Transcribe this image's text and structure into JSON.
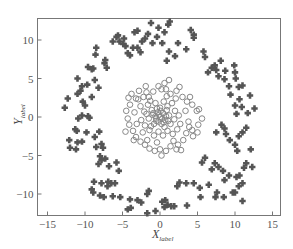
{
  "chart_data": {
    "type": "scatter",
    "title": "",
    "xlabel": "X",
    "xlabel_subscript": "label",
    "ylabel": "Y",
    "ylabel_subscript": "label",
    "xlim": [
      -16.5,
      16
    ],
    "ylim": [
      -12.9,
      12.7
    ],
    "xticks": [
      -15,
      -10,
      -5,
      0,
      5,
      10,
      15
    ],
    "yticks": [
      -10,
      -5,
      0,
      5,
      10
    ],
    "grid": false,
    "legend": null,
    "series": [
      {
        "name": "outer-ring",
        "marker": "plus-diamond-filled",
        "color": "#555555",
        "points": [
          [
            -12.3,
            2.4
          ],
          [
            -12.7,
            1.2
          ],
          [
            -12.1,
            -3.0
          ],
          [
            -12.0,
            -4.0
          ],
          [
            -11.2,
            -4.2
          ],
          [
            -11.0,
            -3.3
          ],
          [
            -11.1,
            -1.8
          ],
          [
            -11.3,
            -1.6
          ],
          [
            -10.4,
            -3.2
          ],
          [
            -11.0,
            3.0
          ],
          [
            -10.6,
            3.4
          ],
          [
            -10.3,
            2.0
          ],
          [
            -10.0,
            1.5
          ],
          [
            -10.4,
            0.2
          ],
          [
            -10.9,
            -0.2
          ],
          [
            -9.6,
            0.1
          ],
          [
            -9.1,
            2.6
          ],
          [
            -11.0,
            5.0
          ],
          [
            -10.4,
            4.0
          ],
          [
            -9.7,
            4.2
          ],
          [
            -9.6,
            6.5
          ],
          [
            -9.1,
            6.2
          ],
          [
            -8.9,
            6.3
          ],
          [
            -8.7,
            4.8
          ],
          [
            -8.2,
            3.8
          ],
          [
            -8.5,
            9.0
          ],
          [
            -8.6,
            8.1
          ],
          [
            -7.4,
            7.0
          ],
          [
            -7.3,
            7.4
          ],
          [
            -7.1,
            6.4
          ],
          [
            -6.3,
            9.8
          ],
          [
            -5.8,
            10.4
          ],
          [
            -5.6,
            10.6
          ],
          [
            -5.4,
            9.8
          ],
          [
            -4.9,
            9.5
          ],
          [
            -4.8,
            10.2
          ],
          [
            -4.3,
            8.3
          ],
          [
            -4.0,
            8.0
          ],
          [
            -4.6,
            9.2
          ],
          [
            -3.6,
            9.0
          ],
          [
            -3.0,
            9.0
          ],
          [
            -2.6,
            8.4
          ],
          [
            -1.6,
            10.8
          ],
          [
            -1.2,
            12.2
          ],
          [
            -0.4,
            10.4
          ],
          [
            0.3,
            9.6
          ],
          [
            0.6,
            11.0
          ],
          [
            1.1,
            12.0
          ],
          [
            1.3,
            12.4
          ],
          [
            -1.0,
            9.6
          ],
          [
            -0.2,
            11.6
          ],
          [
            1.2,
            8.5
          ],
          [
            0.9,
            7.3
          ],
          [
            2.0,
            7.9
          ],
          [
            2.4,
            9.6
          ],
          [
            3.5,
            8.8
          ],
          [
            4.1,
            11.3
          ],
          [
            4.5,
            10.7
          ],
          [
            4.5,
            10.3
          ],
          [
            5.8,
            8.5
          ],
          [
            6.0,
            7.8
          ],
          [
            6.4,
            5.8
          ],
          [
            6.9,
            6.4
          ],
          [
            7.5,
            6.1
          ],
          [
            7.3,
            6.7
          ],
          [
            7.8,
            5.3
          ],
          [
            8.1,
            7.3
          ],
          [
            8.6,
            4.9
          ],
          [
            8.7,
            6.0
          ],
          [
            9.2,
            4.0
          ],
          [
            9.9,
            6.7
          ],
          [
            10.0,
            5.8
          ],
          [
            10.1,
            5.0
          ],
          [
            10.5,
            3.9
          ],
          [
            11.0,
            4.1
          ],
          [
            9.4,
            2.9
          ],
          [
            10.6,
            2.3
          ],
          [
            10.0,
            1.5
          ],
          [
            10.9,
            1.3
          ],
          [
            10.2,
            0.4
          ],
          [
            12.0,
            2.8
          ],
          [
            12.6,
            1.1
          ],
          [
            11.7,
            0.5
          ],
          [
            8.2,
            -1.0
          ],
          [
            8.6,
            -1.5
          ],
          [
            7.5,
            -2.0
          ],
          [
            8.8,
            -2.2
          ],
          [
            9.3,
            -3.0
          ],
          [
            10.0,
            -3.6
          ],
          [
            10.5,
            -2.5
          ],
          [
            11.0,
            -2.0
          ],
          [
            11.5,
            -1.4
          ],
          [
            10.3,
            -4.4
          ],
          [
            12.1,
            -4.2
          ],
          [
            5.6,
            -5.9
          ],
          [
            6.0,
            -5.3
          ],
          [
            7.3,
            -6.0
          ],
          [
            6.9,
            -6.8
          ],
          [
            7.8,
            -6.5
          ],
          [
            8.4,
            -7.0
          ],
          [
            9.2,
            -7.6
          ],
          [
            10.2,
            -7.8
          ],
          [
            10.6,
            -7.6
          ],
          [
            11.2,
            -6.6
          ],
          [
            11.5,
            -6.0
          ],
          [
            11.0,
            -8.6
          ],
          [
            10.5,
            -9.0
          ],
          [
            10.0,
            -9.8
          ],
          [
            11.0,
            -10.9
          ],
          [
            12.3,
            -6.5
          ],
          [
            8.6,
            -8.2
          ],
          [
            7.6,
            -9.8
          ],
          [
            7.4,
            -10.4
          ],
          [
            8.5,
            -10.4
          ],
          [
            9.7,
            -9.8
          ],
          [
            5.3,
            -9.2
          ],
          [
            2.3,
            -9.0
          ],
          [
            2.6,
            -8.5
          ],
          [
            3.5,
            -8.6
          ],
          [
            4.5,
            -8.6
          ],
          [
            6.5,
            -8.8
          ],
          [
            5.4,
            -10.4
          ],
          [
            3.6,
            -11.5
          ],
          [
            0.7,
            -10.8
          ],
          [
            1.0,
            -11.4
          ],
          [
            -1.5,
            -9.6
          ],
          [
            -1.7,
            -10.0
          ],
          [
            0.3,
            -11.0
          ],
          [
            0.6,
            -11.7
          ],
          [
            1.5,
            -11.6
          ],
          [
            1.9,
            -11.6
          ],
          [
            -0.6,
            -12.2
          ],
          [
            -1.7,
            -12.5
          ],
          [
            -3.9,
            -11.8
          ],
          [
            -4.3,
            -12.0
          ],
          [
            -2.5,
            -11.1
          ],
          [
            -3.0,
            -10.8
          ],
          [
            -4.0,
            -10.7
          ],
          [
            -5.3,
            -10.4
          ],
          [
            -6.3,
            -10.3
          ],
          [
            -7.5,
            -10.4
          ],
          [
            -8.0,
            -10.2
          ],
          [
            -8.9,
            -9.8
          ],
          [
            -9.1,
            -9.4
          ],
          [
            -8.8,
            -8.4
          ],
          [
            -7.8,
            -8.6
          ],
          [
            -7.0,
            -9.0
          ],
          [
            -6.9,
            -8.4
          ],
          [
            -6.5,
            -8.6
          ],
          [
            -6.0,
            -8.6
          ],
          [
            -7.8,
            -5.6
          ],
          [
            -8.0,
            -5.1
          ],
          [
            -8.2,
            -6.1
          ],
          [
            -7.3,
            -5.4
          ],
          [
            -6.8,
            -6.4
          ],
          [
            -5.5,
            -7.0
          ],
          [
            -5.8,
            -5.9
          ],
          [
            -9.4,
            -0.1
          ],
          [
            -9.8,
            -2.0
          ],
          [
            -8.1,
            -1.9
          ],
          [
            -7.8,
            -3.5
          ],
          [
            -7.6,
            -4.0
          ],
          [
            -8.7,
            -2.6
          ],
          [
            -8.5,
            -3.9
          ],
          [
            -3.0,
            11.2
          ],
          [
            -2.0,
            10.2
          ],
          [
            -3.4,
            11.0
          ],
          [
            -2.4,
            9.8
          ]
        ]
      },
      {
        "name": "inner-cluster",
        "marker": "circle-open",
        "color": "#888888",
        "points": [
          [
            -3.8,
            3.0
          ],
          [
            -3.2,
            2.4
          ],
          [
            -2.9,
            2.3
          ],
          [
            -2.8,
            3.4
          ],
          [
            -2.2,
            2.6
          ],
          [
            -1.8,
            3.2
          ],
          [
            -1.3,
            2.1
          ],
          [
            -0.9,
            3.3
          ],
          [
            -0.2,
            4.0
          ],
          [
            0.2,
            3.6
          ],
          [
            0.6,
            4.4
          ],
          [
            0.8,
            3.6
          ],
          [
            1.4,
            3.0
          ],
          [
            2.2,
            3.4
          ],
          [
            2.6,
            3.9
          ],
          [
            3.0,
            2.6
          ],
          [
            3.6,
            2.0
          ],
          [
            4.3,
            1.6
          ],
          [
            4.9,
            0.8
          ],
          [
            5.2,
            1.0
          ],
          [
            5.6,
            -0.2
          ],
          [
            5.1,
            -1.0
          ],
          [
            4.3,
            -1.7
          ],
          [
            3.5,
            -2.1
          ],
          [
            3.1,
            -3.0
          ],
          [
            2.4,
            -3.6
          ],
          [
            2.2,
            -4.2
          ],
          [
            1.4,
            -3.8
          ],
          [
            0.8,
            -4.4
          ],
          [
            0.0,
            -4.2
          ],
          [
            -0.7,
            -4.4
          ],
          [
            -1.4,
            -4.1
          ],
          [
            -2.0,
            -3.6
          ],
          [
            -2.6,
            -3.2
          ],
          [
            -3.2,
            -2.6
          ],
          [
            -3.6,
            -1.8
          ],
          [
            -4.1,
            -1.0
          ],
          [
            -4.3,
            -0.2
          ],
          [
            -4.5,
            0.8
          ],
          [
            -4.0,
            1.6
          ],
          [
            -2.6,
            1.4
          ],
          [
            -2.1,
            0.7
          ],
          [
            -1.6,
            1.6
          ],
          [
            -1.1,
            0.9
          ],
          [
            -0.6,
            1.8
          ],
          [
            0.0,
            1.2
          ],
          [
            0.5,
            2.0
          ],
          [
            1.0,
            1.4
          ],
          [
            1.6,
            1.8
          ],
          [
            2.0,
            0.8
          ],
          [
            2.5,
            0.2
          ],
          [
            2.7,
            -0.9
          ],
          [
            2.3,
            -1.6
          ],
          [
            1.7,
            -2.2
          ],
          [
            1.0,
            -1.8
          ],
          [
            0.4,
            -2.4
          ],
          [
            -0.2,
            -1.9
          ],
          [
            -0.8,
            -2.4
          ],
          [
            -1.4,
            -1.7
          ],
          [
            -2.0,
            -1.1
          ],
          [
            -2.5,
            -0.4
          ],
          [
            -1.5,
            -0.2
          ],
          [
            -1.0,
            0.3
          ],
          [
            -0.5,
            -0.5
          ],
          [
            0.0,
            0.0
          ],
          [
            0.4,
            0.5
          ],
          [
            0.7,
            -0.4
          ],
          [
            1.2,
            0.2
          ],
          [
            -0.3,
            0.6
          ],
          [
            0.2,
            -0.9
          ],
          [
            -0.8,
            -0.9
          ],
          [
            1.4,
            -0.9
          ],
          [
            -1.8,
            0.4
          ],
          [
            0.9,
            0.9
          ],
          [
            -0.4,
            1.1
          ],
          [
            0.6,
            -1.3
          ],
          [
            -1.2,
            -1.2
          ],
          [
            1.9,
            -0.3
          ],
          [
            -2.3,
            -2.0
          ],
          [
            2.1,
            2.4
          ],
          [
            -3.4,
            0.6
          ],
          [
            3.4,
            0.8
          ],
          [
            3.8,
            -0.6
          ],
          [
            -3.1,
            -0.9
          ],
          [
            1.8,
            -3.1
          ],
          [
            -1.7,
            -3.0
          ],
          [
            -0.4,
            -3.3
          ],
          [
            0.9,
            2.7
          ],
          [
            -1.5,
            2.6
          ],
          [
            3.9,
            -1.3
          ],
          [
            4.0,
            2.6
          ],
          [
            -4.2,
            2.5
          ],
          [
            -3.5,
            -3.0
          ],
          [
            4.4,
            -2.5
          ],
          [
            0.2,
            -5.0
          ],
          [
            -1.9,
            4.0
          ],
          [
            2.8,
            -4.3
          ],
          [
            -4.6,
            -1.9
          ],
          [
            5.0,
            -2.0
          ],
          [
            1.2,
            4.8
          ],
          [
            -0.1,
            0.3
          ],
          [
            0.3,
            -0.2
          ],
          [
            -0.6,
            0.1
          ],
          [
            0.8,
            0.1
          ],
          [
            -0.2,
            -0.6
          ],
          [
            0.1,
            0.8
          ],
          [
            -0.9,
            0.5
          ],
          [
            1.1,
            -0.5
          ],
          [
            0.5,
            -0.7
          ],
          [
            -0.5,
            -0.2
          ]
        ]
      }
    ]
  }
}
